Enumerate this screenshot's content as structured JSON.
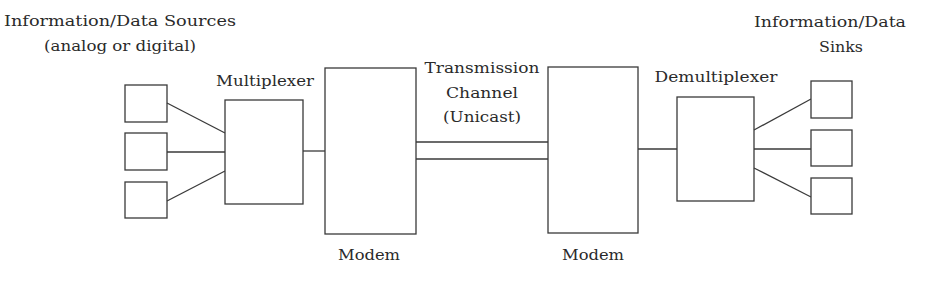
{
  "labels": {
    "sources_line1": "Information/Data Sources",
    "sources_line2": "(analog or digital)",
    "multiplexer": "Multiplexer",
    "modem_left": "Modem",
    "channel_line1": "Transmission",
    "channel_line2": "Channel",
    "channel_line3": "(Unicast)",
    "modem_right": "Modem",
    "demultiplexer": "Demultiplexer",
    "sinks_line1": "Information/Data",
    "sinks_line2": "Sinks"
  },
  "nodes": {
    "sources": [
      {
        "id": "source-1"
      },
      {
        "id": "source-2"
      },
      {
        "id": "source-3"
      }
    ],
    "sinks": [
      {
        "id": "sink-1"
      },
      {
        "id": "sink-2"
      },
      {
        "id": "sink-3"
      }
    ]
  },
  "colors": {
    "stroke": "#3a3a3a",
    "text": "#2a2a2a",
    "background": "#ffffff"
  }
}
